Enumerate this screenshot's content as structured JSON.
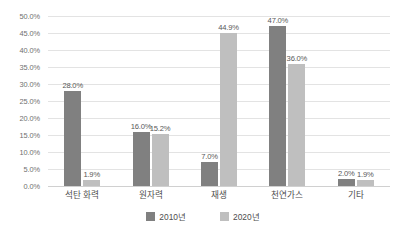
{
  "chart_data": {
    "type": "bar",
    "title": "",
    "subtitle": "",
    "xlabel": "",
    "ylabel": "",
    "categories": [
      "석탄 화력",
      "원자력",
      "재생",
      "천연가스",
      "기타"
    ],
    "series": [
      {
        "name": "2010년",
        "color": "#808080",
        "values": [
          28.0,
          16.0,
          7.0,
          47.0,
          2.0
        ]
      },
      {
        "name": "2020년",
        "color": "#bfbfbf",
        "values": [
          1.9,
          15.2,
          44.9,
          36.0,
          1.9
        ]
      }
    ],
    "value_labels": [
      [
        "28.0%",
        "16.0%",
        "7.0%",
        "47.0%",
        "2.0%"
      ],
      [
        "1.9%",
        "15.2%",
        "44.9%",
        "36.0%",
        "1.9%"
      ]
    ],
    "ylim": [
      0,
      50
    ],
    "ytick_step": 5,
    "ytick_labels": [
      "0.0%",
      "5.0%",
      "10.0%",
      "15.0%",
      "20.0%",
      "25.0%",
      "30.0%",
      "35.0%",
      "40.0%",
      "45.0%",
      "50.0%"
    ],
    "ytick_values": [
      0,
      5,
      10,
      15,
      20,
      25,
      30,
      35,
      40,
      45,
      50
    ],
    "grid": true,
    "grid_color": "#e3e3e3",
    "legend_position": "bottom",
    "value_labels_shown": true,
    "background": "#ffffff"
  }
}
